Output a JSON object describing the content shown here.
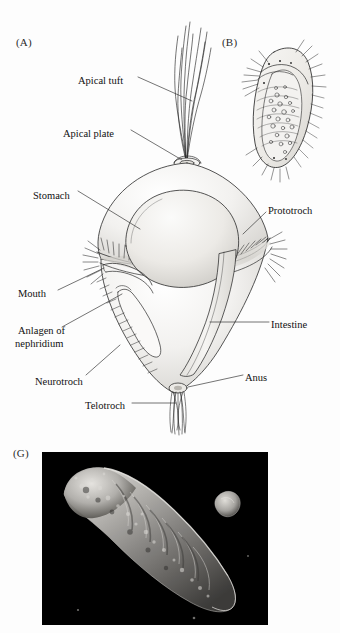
{
  "figure": {
    "background_color": "#fdfdfd",
    "ink_color": "#1a1a1a",
    "photo_background_color": "#000000"
  },
  "panels": [
    {
      "id": "A",
      "letter": "(A)",
      "caption": "",
      "kind": "line-drawing",
      "subject": "trochophore larva, lateral view",
      "labels": [
        {
          "name": "apical-tuft",
          "text": "Apical tuft",
          "x": 78,
          "y": 75,
          "align": "left"
        },
        {
          "name": "apical-plate",
          "text": "Apical plate",
          "x": 63,
          "y": 128,
          "align": "left"
        },
        {
          "name": "stomach",
          "text": "Stomach",
          "x": 33,
          "y": 190,
          "align": "left"
        },
        {
          "name": "prototroch",
          "text": "Prototroch",
          "x": 268,
          "y": 205,
          "align": "left"
        },
        {
          "name": "mouth",
          "text": "Mouth",
          "x": 18,
          "y": 288,
          "align": "left"
        },
        {
          "name": "anlagen-of-nephridium-line1",
          "text": "Anlagen of",
          "x": 18,
          "y": 325,
          "align": "left"
        },
        {
          "name": "anlagen-of-nephridium-line2",
          "text": "nephridium",
          "x": 15,
          "y": 338,
          "align": "left"
        },
        {
          "name": "intestine",
          "text": "Intestine",
          "x": 271,
          "y": 319,
          "align": "left"
        },
        {
          "name": "anus",
          "text": "Anus",
          "x": 245,
          "y": 372,
          "align": "left"
        },
        {
          "name": "neurotroch",
          "text": "Neurotroch",
          "x": 35,
          "y": 376,
          "align": "left"
        },
        {
          "name": "telotroch",
          "text": "Telotroch",
          "x": 85,
          "y": 400,
          "align": "left"
        }
      ]
    },
    {
      "id": "B",
      "letter": "(B)",
      "kind": "line-drawing",
      "subject": "later larval stage, oblique view",
      "labels": []
    },
    {
      "id": "G",
      "letter": "(G)",
      "kind": "electron-micrograph",
      "subject": "scanning electron micrograph of segmented larva",
      "labels": []
    }
  ]
}
